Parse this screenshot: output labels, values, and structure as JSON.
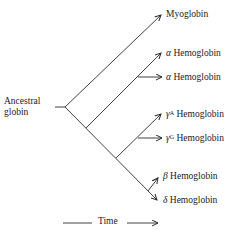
{
  "diagram": {
    "type": "phylogenetic-tree",
    "root": {
      "label_line1": "Ancestral",
      "label_line2": "globin"
    },
    "leaves": [
      {
        "id": "myoglobin",
        "prefix": "",
        "sup": "",
        "name": "Myoglobin"
      },
      {
        "id": "alpha1",
        "prefix": "α",
        "sup": "",
        "name": "Hemoglobin"
      },
      {
        "id": "alpha2",
        "prefix": "α",
        "sup": "",
        "name": "Hemoglobin"
      },
      {
        "id": "gammaA",
        "prefix": "γ",
        "sup": "A",
        "name": "Hemoglobin"
      },
      {
        "id": "gammaG",
        "prefix": "γ",
        "sup": "G",
        "name": "Hemoglobin"
      },
      {
        "id": "beta",
        "prefix": "β",
        "sup": "",
        "name": "Hemoglobin"
      },
      {
        "id": "delta",
        "prefix": "δ",
        "sup": "",
        "name": "Hemoglobin"
      }
    ],
    "axis": {
      "label": "Time"
    },
    "colors": {
      "line": "#2a2a2a",
      "text": "#1a1a1a",
      "background": "#ffffff"
    }
  }
}
